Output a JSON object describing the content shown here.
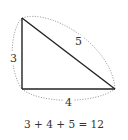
{
  "diagram": {
    "vertices": {
      "top": [
        22,
        18
      ],
      "bottom_left": [
        22,
        89
      ],
      "bottom_right": [
        115,
        89
      ]
    },
    "sides": [
      {
        "name": "left",
        "label": "3",
        "label_pos": [
          12,
          61
        ]
      },
      {
        "name": "bottom",
        "label": "4",
        "label_pos": [
          68,
          104
        ]
      },
      {
        "name": "hypotenuse",
        "label": "5",
        "label_pos": [
          78,
          45
        ]
      }
    ],
    "equation": "3 + 4 + 5 = 12",
    "colors": {
      "edge": "#222222",
      "dotted_arc": "#999999",
      "text": "#333333"
    }
  }
}
